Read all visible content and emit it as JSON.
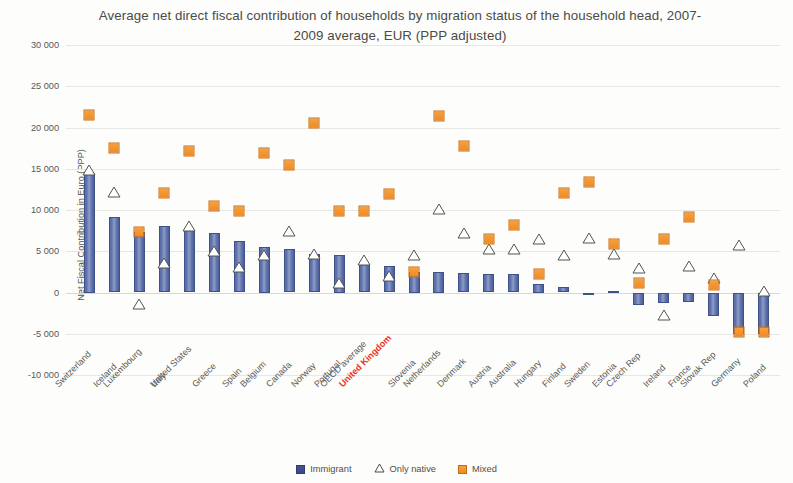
{
  "chart_data": {
    "type": "scatter",
    "title": "Average net direct fiscal contribution of households by migration status of the household head, 2007-2009 average, EUR (PPP adjusted)",
    "xlabel": "",
    "ylabel": "Net Fiscal Contribution in Euro (PPP)",
    "ylim": [
      -10000,
      30000
    ],
    "ytick_step": 5000,
    "ytick_labels": [
      "30 000",
      "25 000",
      "20 000",
      "15 000",
      "10 000",
      "5 000",
      "0",
      "-5 000",
      "-10 000"
    ],
    "ytick_values": [
      30000,
      25000,
      20000,
      15000,
      10000,
      5000,
      0,
      -5000,
      -10000
    ],
    "grid": true,
    "legend_position": "bottom",
    "highlight_category": "United Kingdom",
    "highlight_color": "#ee2d24",
    "colors": {
      "immigrant": "#4a5d97",
      "only_native": "#ffffff",
      "mixed": "#ef8b22"
    },
    "categories": [
      "Switzerland",
      "Iceland",
      "Luxembourg",
      "Italy",
      "United States",
      "Greece",
      "Spain",
      "Belgium",
      "Canada",
      "Norway",
      "Portugal",
      "OECD average",
      "United Kingdom",
      "Slovenia",
      "Netherlands",
      "Denmark",
      "Austria",
      "Australia",
      "Hungary",
      "Finland",
      "Sweden",
      "Estonia",
      "Czech Rep",
      "Ireland",
      "France",
      "Slovak Rep",
      "Germany",
      "Poland"
    ],
    "series": [
      {
        "name": "Immigrant",
        "marker": "bar",
        "values": [
          14500,
          9200,
          7300,
          8100,
          7600,
          7200,
          6300,
          5500,
          5300,
          4700,
          4500,
          3400,
          3200,
          2500,
          2500,
          2400,
          2300,
          2200,
          1000,
          700,
          0,
          200,
          -1500,
          -1300,
          -1200,
          -2900,
          -5000,
          -5000
        ]
      },
      {
        "name": "Only native",
        "marker": "triangle",
        "values": [
          14800,
          12200,
          -1400,
          3600,
          8100,
          5000,
          3100,
          4600,
          7400,
          4700,
          1100,
          4000,
          2000,
          4500,
          10100,
          7200,
          5300,
          5300,
          6500,
          4600,
          6600,
          4700,
          3000,
          -2700,
          3200,
          1800,
          5700,
          200
        ]
      },
      {
        "name": "Mixed",
        "marker": "square",
        "values": [
          21500,
          17500,
          7300,
          12100,
          17200,
          10500,
          9900,
          16900,
          15500,
          20500,
          9900,
          9900,
          11900,
          2500,
          21400,
          17800,
          6500,
          8200,
          2300,
          12100,
          13400,
          5900,
          1200,
          6500,
          9100,
          900,
          -4800,
          -4800
        ]
      }
    ]
  },
  "legend": {
    "items": [
      {
        "label": "Immigrant",
        "icon": "square-blue"
      },
      {
        "label": "Only native",
        "icon": "triangle-white"
      },
      {
        "label": "Mixed",
        "icon": "square-orange"
      }
    ]
  }
}
